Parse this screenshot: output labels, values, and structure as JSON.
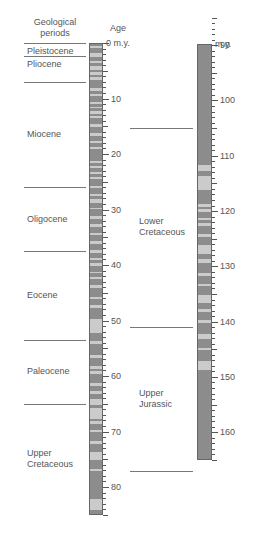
{
  "header": {
    "periods_label_line1": "Geological",
    "periods_label_line2": "periods",
    "age_label": "Age"
  },
  "left_column": {
    "unit_label": "0 m.y.",
    "range": [
      0,
      85
    ],
    "tick_labels": [
      "10",
      "20",
      "30",
      "40",
      "50",
      "60",
      "70",
      "80"
    ],
    "periods": [
      {
        "name": "Pleistocene",
        "lines": [
          "Pleistocene"
        ]
      },
      {
        "name": "Pliocene",
        "lines": [
          "Pliocene"
        ]
      },
      {
        "name": "Miocene",
        "lines": [
          "Miocene"
        ]
      },
      {
        "name": "Oligocene",
        "lines": [
          "Oligocene"
        ]
      },
      {
        "name": "Eocene",
        "lines": [
          "Eocene"
        ]
      },
      {
        "name": "Paleocene",
        "lines": [
          "Paleocene"
        ]
      },
      {
        "name": "Upper Cretaceous",
        "lines": [
          "Upper",
          "Cretaceous"
        ]
      }
    ],
    "boundaries_my": [
      0,
      2.3,
      7,
      26,
      37.5,
      53.5,
      65,
      85
    ]
  },
  "right_column": {
    "unit_label": "m.y.",
    "range": [
      85,
      165
    ],
    "tick_labels": [
      "90",
      "100",
      "110",
      "120",
      "130",
      "140",
      "150",
      "160"
    ],
    "periods": [
      {
        "name": "Lower Cretaceous",
        "lines": [
          "Lower",
          "Cretaceous"
        ]
      },
      {
        "name": "Upper Jurassic",
        "lines": [
          "Upper",
          "Jurassic"
        ]
      }
    ],
    "boundaries_my": [
      100,
      136,
      162
    ]
  },
  "chart_data": {
    "type": "diagram",
    "xlabel": "Geological periods",
    "ylabel": "Age (m.y.)",
    "columns": [
      {
        "range_my": [
          0,
          85
        ],
        "light_bands_my": [
          [
            0.3,
            0.8
          ],
          [
            1.6,
            2.4
          ],
          [
            3.1,
            3.4
          ],
          [
            4.0,
            4.6
          ],
          [
            5.0,
            5.6
          ],
          [
            6.0,
            6.4
          ],
          [
            8.0,
            8.4
          ],
          [
            9.0,
            9.3
          ],
          [
            10.5,
            10.8
          ],
          [
            11.3,
            11.6
          ],
          [
            12.0,
            12.6
          ],
          [
            13.0,
            13.3
          ],
          [
            14.5,
            14.9
          ],
          [
            16.0,
            16.6
          ],
          [
            17.5,
            17.8
          ],
          [
            18.5,
            19.0
          ],
          [
            21.0,
            21.4
          ],
          [
            22.0,
            22.4
          ],
          [
            23.0,
            23.5
          ],
          [
            24.0,
            24.4
          ],
          [
            25.5,
            26.0
          ],
          [
            27.0,
            27.4
          ],
          [
            28.0,
            28.6
          ],
          [
            29.5,
            29.8
          ],
          [
            31.0,
            31.5
          ],
          [
            32.5,
            32.9
          ],
          [
            34.0,
            34.4
          ],
          [
            35.5,
            36.0
          ],
          [
            37.2,
            37.6
          ],
          [
            38.5,
            38.9
          ],
          [
            39.5,
            40.0
          ],
          [
            41.0,
            41.3
          ],
          [
            42.0,
            42.4
          ],
          [
            43.5,
            43.9
          ],
          [
            45.5,
            46.0
          ],
          [
            47.0,
            47.5
          ],
          [
            49.5,
            52.0
          ],
          [
            53.5,
            54.0
          ],
          [
            56.0,
            56.6
          ],
          [
            58.0,
            58.6
          ],
          [
            59.0,
            59.4
          ],
          [
            61.0,
            61.6
          ],
          [
            62.5,
            63.0
          ],
          [
            64.0,
            65.0
          ],
          [
            65.5,
            67.5
          ],
          [
            68.0,
            68.4
          ],
          [
            69.5,
            70.0
          ],
          [
            71.5,
            72.0
          ],
          [
            73.5,
            75.0
          ],
          [
            76.5,
            77.0
          ],
          [
            82.0,
            84.0
          ]
        ]
      },
      {
        "range_my": [
          85,
          165
        ],
        "light_bands_my": [
          [
            111.5,
            112.5
          ],
          [
            113.5,
            116.0
          ],
          [
            118.5,
            119.0
          ],
          [
            119.5,
            120.0
          ],
          [
            121.0,
            121.5
          ],
          [
            122.0,
            122.6
          ],
          [
            124.0,
            124.6
          ],
          [
            126.0,
            127.5
          ],
          [
            128.5,
            129.2
          ],
          [
            131.0,
            131.6
          ],
          [
            133.0,
            133.4
          ],
          [
            135.0,
            136.5
          ],
          [
            137.5,
            138.0
          ],
          [
            139.5,
            140.0
          ],
          [
            142.0,
            143.0
          ],
          [
            144.5,
            145.0
          ],
          [
            147.0,
            148.5
          ]
        ]
      }
    ]
  }
}
